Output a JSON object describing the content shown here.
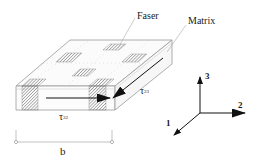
{
  "diagram": {
    "callouts": {
      "fiber": "Faser",
      "matrix": "Matrix"
    },
    "shear": {
      "tau_32": {
        "symbol": "τ",
        "subscript": "32"
      },
      "tau_23": {
        "symbol": "τ",
        "subscript": "23"
      }
    },
    "dimension": {
      "label": "b"
    },
    "axes": {
      "axis_1": "1",
      "axis_2": "2",
      "axis_3": "3"
    },
    "colors": {
      "line": "#9a9a9a",
      "arrow": "#111111",
      "hatch": "#7a7a7a",
      "background": "#ffffff"
    }
  }
}
